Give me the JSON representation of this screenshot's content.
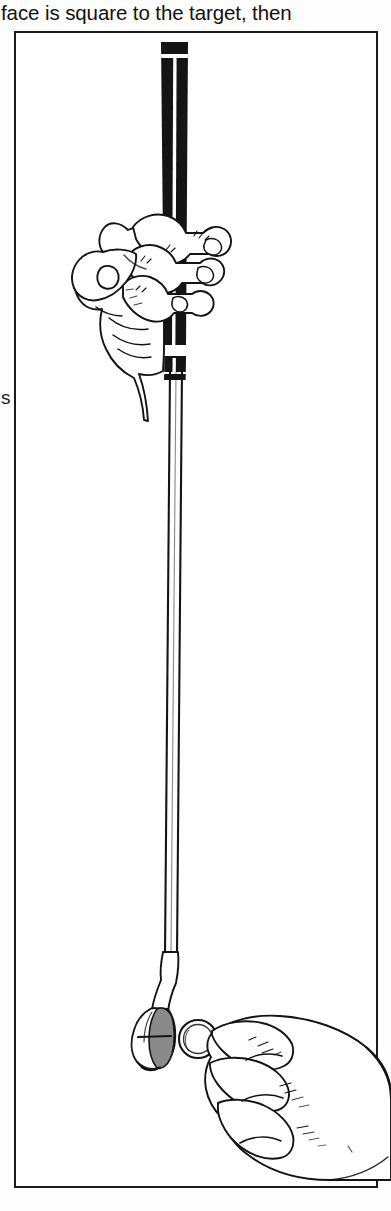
{
  "page": {
    "background_color": "#ffffff",
    "ink_color": "#141414",
    "shade_color": "#8a8a8a"
  },
  "body_text": {
    "line": "face is square to the target, then"
  },
  "margin": {
    "fragment_letter": "s"
  },
  "figure": {
    "caption": "",
    "frame": {
      "border_color": "#1b1b1b",
      "border_width_px": 2,
      "x": 14,
      "y": 31,
      "width": 364,
      "height": 1157
    },
    "elements": [
      {
        "name": "putter-grip",
        "label": "Putter grip",
        "color": "#141414"
      },
      {
        "name": "putter-shaft",
        "label": "Putter shaft",
        "color": "#141414"
      },
      {
        "name": "putter-head",
        "label": "Putter head",
        "color": "#8a8a8a"
      },
      {
        "name": "upper-hand",
        "label": "Hand gripping club",
        "color": "#141414"
      },
      {
        "name": "lower-hand",
        "label": "Hand holding ball",
        "color": "#141414"
      },
      {
        "name": "golf-ball",
        "label": "Golf ball",
        "color": "#ffffff"
      }
    ]
  }
}
